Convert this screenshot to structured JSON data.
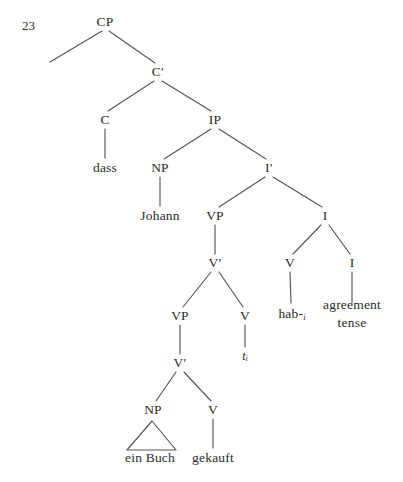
{
  "figure": {
    "example_number": "23",
    "kind": "x-bar-syntax-tree",
    "language_of_example": "German",
    "background_color": "#ffffff",
    "line_color": "#55555a",
    "text_color": "#2b2b2b"
  },
  "nodes": [
    {
      "id": "CP",
      "label": "CP",
      "x": 105,
      "y": 22,
      "type": "phrase"
    },
    {
      "id": "Cbar",
      "label": "C′",
      "x": 158,
      "y": 72,
      "type": "bar"
    },
    {
      "id": "C",
      "label": "C",
      "x": 105,
      "y": 120,
      "type": "head"
    },
    {
      "id": "IP",
      "label": "IP",
      "x": 215,
      "y": 120,
      "type": "phrase"
    },
    {
      "id": "NP1",
      "label": "NP",
      "x": 160,
      "y": 168,
      "type": "phrase"
    },
    {
      "id": "Ibar",
      "label": "I′",
      "x": 269,
      "y": 168,
      "type": "bar"
    },
    {
      "id": "VP1",
      "label": "VP",
      "x": 215,
      "y": 216,
      "type": "phrase"
    },
    {
      "id": "I1",
      "label": "I",
      "x": 325,
      "y": 216,
      "type": "head"
    },
    {
      "id": "Vbar1",
      "label": "V′",
      "x": 215,
      "y": 263,
      "type": "bar"
    },
    {
      "id": "Vhead_I",
      "label": "V",
      "x": 290,
      "y": 263,
      "type": "head"
    },
    {
      "id": "Ihead_I",
      "label": "I",
      "x": 352,
      "y": 263,
      "type": "head"
    },
    {
      "id": "VP2",
      "label": "VP",
      "x": 180,
      "y": 316,
      "type": "phrase"
    },
    {
      "id": "Vtrace",
      "label": "V",
      "x": 245,
      "y": 316,
      "type": "head"
    },
    {
      "id": "Vbar2",
      "label": "V′",
      "x": 180,
      "y": 363,
      "type": "bar"
    },
    {
      "id": "NP2",
      "label": "NP",
      "x": 153,
      "y": 410,
      "type": "phrase"
    },
    {
      "id": "Vfinal",
      "label": "V",
      "x": 213,
      "y": 410,
      "type": "head"
    }
  ],
  "terminals": [
    {
      "id": "dass",
      "text": "dass",
      "x": 105,
      "y": 168,
      "lines": [
        "dass"
      ]
    },
    {
      "id": "Johann",
      "text": "Johann",
      "x": 160,
      "y": 216,
      "lines": [
        "Johann"
      ]
    },
    {
      "id": "habi",
      "text": "hab-i",
      "x": 292,
      "y": 314,
      "lines": [
        "hab-"
      ],
      "subscript": "i"
    },
    {
      "id": "agreement",
      "text": "agreement tense",
      "x": 352,
      "y": 314,
      "lines": [
        "agreement",
        "tense"
      ]
    },
    {
      "id": "ti",
      "text": "t i",
      "x": 245,
      "y": 356,
      "lines": [
        "t"
      ],
      "subscript": "i",
      "italic": true
    },
    {
      "id": "einBuch",
      "text": "ein Buch",
      "x": 150,
      "y": 458,
      "lines": [
        "ein Buch"
      ]
    },
    {
      "id": "gekauft",
      "text": "gekauft",
      "x": 213,
      "y": 458,
      "lines": [
        "gekauft"
      ]
    }
  ],
  "edges": [
    {
      "from": "CP",
      "to": "empty-spec",
      "x1": 102,
      "y1": 31,
      "x2": 50,
      "y2": 62
    },
    {
      "from": "CP",
      "to": "Cbar",
      "x1": 109,
      "y1": 31,
      "x2": 155,
      "y2": 63
    },
    {
      "from": "Cbar",
      "to": "C",
      "x1": 154,
      "y1": 81,
      "x2": 108,
      "y2": 111
    },
    {
      "from": "Cbar",
      "to": "IP",
      "x1": 162,
      "y1": 81,
      "x2": 211,
      "y2": 111
    },
    {
      "from": "C",
      "to": "dass",
      "x1": 105,
      "y1": 129,
      "x2": 105,
      "y2": 158
    },
    {
      "from": "IP",
      "to": "NP1",
      "x1": 211,
      "y1": 129,
      "x2": 164,
      "y2": 159
    },
    {
      "from": "IP",
      "to": "Ibar",
      "x1": 219,
      "y1": 129,
      "x2": 266,
      "y2": 159
    },
    {
      "from": "NP1",
      "to": "Johann",
      "x1": 160,
      "y1": 177,
      "x2": 160,
      "y2": 206
    },
    {
      "from": "Ibar",
      "to": "VP1",
      "x1": 265,
      "y1": 177,
      "x2": 219,
      "y2": 207
    },
    {
      "from": "Ibar",
      "to": "I1",
      "x1": 273,
      "y1": 177,
      "x2": 322,
      "y2": 207
    },
    {
      "from": "VP1",
      "to": "Vbar1",
      "x1": 215,
      "y1": 225,
      "x2": 215,
      "y2": 254
    },
    {
      "from": "I1",
      "to": "Vhead_I",
      "x1": 321,
      "y1": 225,
      "x2": 293,
      "y2": 254
    },
    {
      "from": "I1",
      "to": "Ihead_I",
      "x1": 329,
      "y1": 225,
      "x2": 350,
      "y2": 254
    },
    {
      "from": "Vbar1",
      "to": "VP2",
      "x1": 211,
      "y1": 272,
      "x2": 183,
      "y2": 307
    },
    {
      "from": "Vbar1",
      "to": "Vtrace",
      "x1": 219,
      "y1": 272,
      "x2": 243,
      "y2": 307
    },
    {
      "from": "Vhead_I",
      "to": "habi",
      "x1": 290,
      "y1": 272,
      "x2": 291,
      "y2": 303
    },
    {
      "from": "Ihead_I",
      "to": "agreement",
      "x1": 352,
      "y1": 272,
      "x2": 352,
      "y2": 303
    },
    {
      "from": "VP2",
      "to": "Vbar2",
      "x1": 180,
      "y1": 325,
      "x2": 180,
      "y2": 354
    },
    {
      "from": "Vtrace",
      "to": "ti",
      "x1": 245,
      "y1": 325,
      "x2": 245,
      "y2": 347
    },
    {
      "from": "Vbar2",
      "to": "NP2",
      "x1": 176,
      "y1": 372,
      "x2": 156,
      "y2": 401
    },
    {
      "from": "Vbar2",
      "to": "Vfinal",
      "x1": 184,
      "y1": 372,
      "x2": 211,
      "y2": 401
    },
    {
      "from": "Vfinal",
      "to": "gekauft",
      "x1": 213,
      "y1": 419,
      "x2": 213,
      "y2": 448
    }
  ],
  "triangle": {
    "node": "NP2",
    "apex_x": 152,
    "apex_y": 421,
    "left_x": 127,
    "left_y": 450,
    "right_x": 176,
    "right_y": 450,
    "covers": "ein Buch"
  },
  "sentence": {
    "gloss_words": [
      "dass",
      "Johann",
      "ein Buch",
      "gekauft",
      "hab-"
    ],
    "full": "dass Johann ein Buch gekauft hab-"
  }
}
